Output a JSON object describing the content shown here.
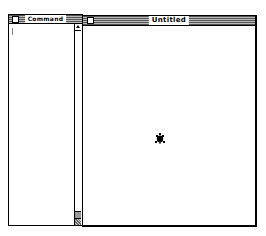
{
  "command_window": {
    "title": "Command",
    "content": ""
  },
  "graphics_window": {
    "title": "Untitled",
    "turtle": {
      "icon": "turtle-icon",
      "heading": "up",
      "color": "#000000"
    }
  },
  "colors": {
    "background": "#ffffff",
    "border": "#000000",
    "titlebar_stripes": "#555555"
  }
}
